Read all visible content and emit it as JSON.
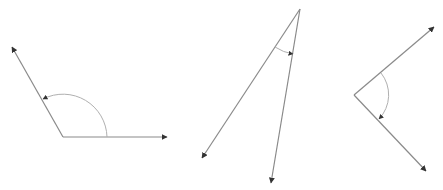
{
  "canvas": {
    "width": 443,
    "height": 190,
    "background": "#ffffff"
  },
  "colors": {
    "ray": "#8a8a8a",
    "arc": "#b0b0b0",
    "arrowhead": "#333333"
  },
  "angles": [
    {
      "name": "obtuse-angle",
      "vertex": [
        63,
        137
      ],
      "rays": [
        {
          "end": [
            12,
            47
          ]
        },
        {
          "end": [
            167,
            137
          ]
        }
      ],
      "arc": {
        "start": [
          107,
          137
        ],
        "end": [
          43,
          99
        ],
        "radius": 44,
        "sweep": 0
      }
    },
    {
      "name": "acute-angle",
      "vertex": [
        300,
        9
      ],
      "rays": [
        {
          "end": [
            202,
            158
          ]
        },
        {
          "end": [
            271,
            183
          ]
        }
      ],
      "arc": {
        "start": [
          275,
          47
        ],
        "end": [
          293,
          54
        ],
        "radius": 46,
        "sweep": 0
      }
    },
    {
      "name": "right-angle",
      "vertex": [
        354,
        95
      ],
      "rays": [
        {
          "end": [
            434,
            27
          ]
        },
        {
          "end": [
            426,
            171
          ]
        }
      ],
      "arc": {
        "start": [
          381,
          73
        ],
        "end": [
          379,
          119
        ],
        "radius": 35,
        "sweep": 1
      }
    }
  ]
}
